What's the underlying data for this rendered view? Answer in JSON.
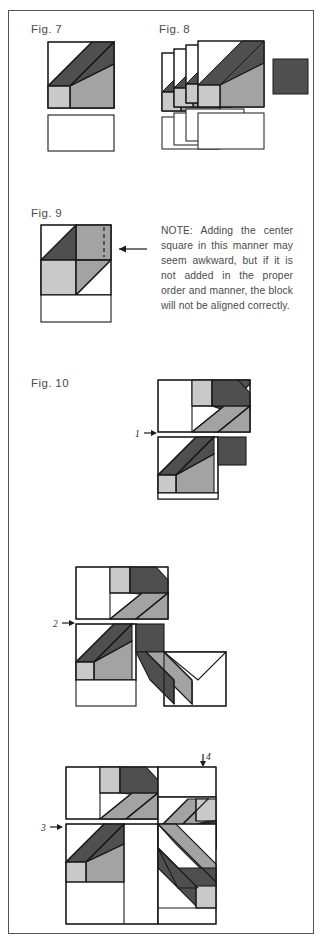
{
  "page": {
    "border_color": "#555555",
    "background": "#ffffff"
  },
  "palette": {
    "white": "#ffffff",
    "light_gray": "#c9c9c9",
    "medium_gray": "#a3a3a3",
    "dark_gray": "#4f4f4f",
    "outline": "#1a1a1a",
    "text": "#4a4a4a"
  },
  "figures": [
    {
      "id": "fig7",
      "label": "Fig. 7",
      "description": "Single pieced unit: square with diagonal bar above a blank rectangle"
    },
    {
      "id": "fig8",
      "label": "Fig. 8",
      "description": "Four stacked identical units plus a dark center square at right"
    },
    {
      "id": "fig9",
      "label": "Fig. 9",
      "description": "Quarter-block detail showing center square attachment with dashed seam line and pointer arrow"
    },
    {
      "id": "fig10",
      "label": "Fig. 10",
      "description": "Three-stage assembly of the full pinwheel block"
    }
  ],
  "note": {
    "text": "NOTE: Adding the center square in this manner may seem awkward, but if it is not added in the proper order and manner, the block will not be aligned correctly."
  },
  "steps": [
    {
      "number": "1",
      "arrow": "right",
      "stage": "two units joined"
    },
    {
      "number": "2",
      "arrow": "right",
      "stage": "three units joined"
    },
    {
      "number": "3",
      "arrow": "right",
      "stage": "four units joined"
    },
    {
      "number": "4",
      "arrow": "down",
      "stage": "final seam"
    }
  ],
  "icons": {
    "pointer_arrow": "arrow-left-icon",
    "step_arrow": "arrow-right-icon",
    "step_arrow_down": "arrow-down-icon"
  }
}
